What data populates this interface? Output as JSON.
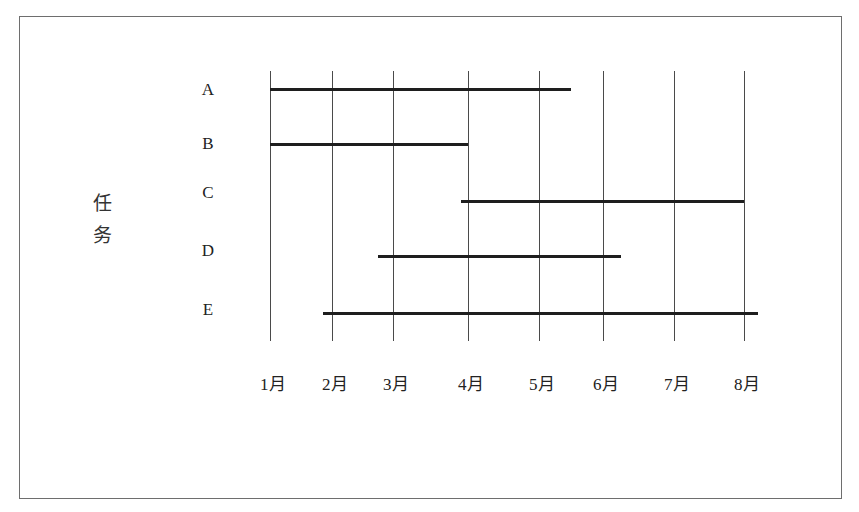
{
  "chart_data": {
    "type": "gantt",
    "title": "",
    "ylabel": "任务",
    "xlabel": "",
    "categories": [
      "1月",
      "2月",
      "3月",
      "4月",
      "5月",
      "6月",
      "7月",
      "8月"
    ],
    "tasks": [
      {
        "name": "A",
        "start": 1.0,
        "end": 5.5
      },
      {
        "name": "B",
        "start": 1.0,
        "end": 4.0
      },
      {
        "name": "C",
        "start": 3.9,
        "end": 8.0
      },
      {
        "name": "D",
        "start": 2.75,
        "end": 6.25
      },
      {
        "name": "E",
        "start": 1.85,
        "end": 8.2
      }
    ],
    "grid": {
      "vertical": true,
      "horizontal": false
    },
    "legend": null,
    "xlim": [
      1,
      8
    ]
  },
  "axis": {
    "y_title_chars": [
      "任",
      "务"
    ],
    "month_labels": [
      "1月",
      "2月",
      "3月",
      "4月",
      "5月",
      "6月",
      "7月",
      "8月"
    ],
    "task_labels": [
      "A",
      "B",
      "C",
      "D",
      "E"
    ]
  },
  "colors": {
    "bar": "#1e1e1e",
    "grid": "#4a4a4a",
    "frame": "#6e6e6e",
    "text": "#222222"
  }
}
